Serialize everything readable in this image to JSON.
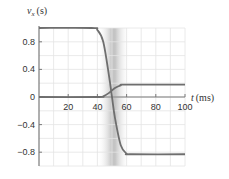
{
  "chart_data": {
    "type": "line",
    "title": "",
    "xlabel": "t (ms)",
    "ylabel": "v_x (s)",
    "xlabel_var": "t",
    "xlabel_unit": "(ms)",
    "ylabel_var": "v",
    "ylabel_sub": "x",
    "ylabel_unit": "(s)",
    "xlim": [
      0,
      100
    ],
    "ylim": [
      -1.0,
      1.0
    ],
    "x_ticks": [
      20,
      40,
      60,
      80,
      100
    ],
    "x_tick_labels": [
      "20",
      "40",
      "60",
      "80",
      "100"
    ],
    "y_ticks": [
      0.8,
      0.4,
      0,
      -0.4,
      -0.8
    ],
    "y_tick_labels": [
      "0.8",
      "0.4",
      "0",
      "−0.4",
      "−0.8"
    ],
    "grid": true,
    "grid_x_step": 10,
    "grid_y_step": 0.2,
    "shaded_region": {
      "x_start": 40,
      "x_end": 62,
      "peak": 50
    },
    "series": [
      {
        "name": "falling",
        "x": [
          0,
          36,
          40,
          44,
          48,
          50,
          52,
          56,
          60,
          63,
          100
        ],
        "values": [
          1.0,
          1.0,
          0.97,
          0.8,
          0.3,
          0.0,
          -0.3,
          -0.7,
          -0.82,
          -0.83,
          -0.83
        ]
      },
      {
        "name": "rising",
        "x": [
          0,
          40,
          44,
          48,
          52,
          56,
          60,
          100
        ],
        "values": [
          0,
          0,
          0.01,
          0.06,
          0.13,
          0.17,
          0.18,
          0.18
        ]
      }
    ]
  },
  "colors": {
    "curve": "#6e6e6e",
    "axis": "#7a7a7a",
    "grid": "#e4e4e4",
    "shade": "#c8c8c8"
  }
}
